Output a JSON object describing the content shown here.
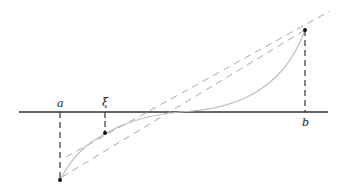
{
  "diagram": {
    "type": "mean-value-theorem-illustration",
    "labels": {
      "a": "a",
      "xi": "ξ",
      "b": "b"
    },
    "colors": {
      "axis": "#333333",
      "curve": "#bbbbbb",
      "dashed_lines": "#aaaaaa",
      "verticals": "#333333",
      "points": "#111111"
    },
    "elements": [
      "x-axis",
      "curve f(x)",
      "secant line through (a,f(a)) and (b,f(b))",
      "tangent line at ξ parallel to secant",
      "vertical dashed line at a",
      "vertical dashed line at ξ",
      "vertical dashed line at b"
    ]
  }
}
